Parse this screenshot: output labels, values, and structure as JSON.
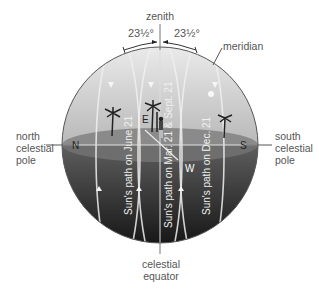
{
  "labels": {
    "zenith": "zenith",
    "angle_left": "23½°",
    "angle_right": "23½°",
    "meridian": "meridian",
    "north_pole": [
      "north",
      "celestial",
      "pole"
    ],
    "south_pole": [
      "south",
      "celestial",
      "pole"
    ],
    "celestial_equator": [
      "celestial",
      "equator"
    ],
    "north_marker": "N",
    "south_marker": "S",
    "east_marker": "E",
    "west_marker": "W"
  },
  "paths": {
    "june": "Sun's path on June 21",
    "equinox": "Sun's path on Mar. 21 & Sept. 21",
    "december": "Sun's path on Dec. 21"
  },
  "colors": {
    "sky_top": "#e6e6e6",
    "sky_bottom": "#bdbdbd",
    "horizon_plane": "#7a7a7a",
    "below_horizon_top": "#5a5a5a",
    "below_horizon_bottom": "#1e1e1e",
    "path_line": "#f2f2f2",
    "label_text": "#555555"
  }
}
